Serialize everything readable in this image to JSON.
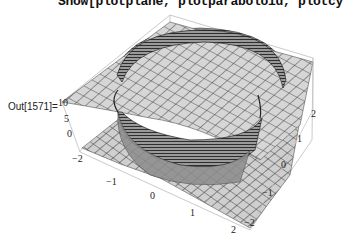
{
  "notebook": {
    "input_line": "Show[plotplane, plotparaboloid, plotcy",
    "output_label": "Out[1571]="
  },
  "plot": {
    "type": "3d-surface",
    "description": "Plane, paraboloid and cylinder surfaces shown together",
    "axes": {
      "x_ticks": [
        "−2",
        "−1",
        "0",
        "1",
        "2"
      ],
      "y_ticks": [
        "−2",
        "−1",
        "0",
        "1",
        "2"
      ],
      "z_ticks": [
        "10",
        "5",
        "0"
      ]
    },
    "colors": {
      "surface": "#d4d4d4",
      "mesh": "#444444",
      "cylinder": "#555555",
      "box": "#b8b8b8"
    }
  }
}
